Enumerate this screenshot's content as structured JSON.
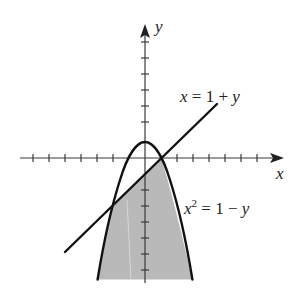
{
  "diagram": {
    "type": "region-between-curves",
    "colors": {
      "axis": "#3a3a3a",
      "curve": "#111111",
      "shade": "#b9b9b9",
      "background": "#ffffff"
    },
    "axes": {
      "x_label": "x",
      "y_label": "y",
      "x_ticks": [
        -7,
        -6,
        -5,
        -4,
        -3,
        -2,
        -1,
        1,
        2,
        3,
        4,
        5,
        6,
        7
      ],
      "y_ticks": [
        -7,
        -6,
        -5,
        -4,
        -3,
        -2,
        -1,
        1,
        2,
        3,
        4,
        5,
        6,
        7
      ]
    },
    "curves": [
      {
        "name": "line",
        "equation": {
          "lhs": "x",
          "eq": "=",
          "c": "1",
          "op": "+",
          "v": "y"
        },
        "label": "x = 1 + y"
      },
      {
        "name": "parabola",
        "equation": {
          "lhs": "x",
          "sup": "2",
          "eq": "=",
          "c": "1",
          "op": "−",
          "v": "y"
        },
        "label": "x² = 1 − y"
      }
    ],
    "intersections": [
      [
        -2,
        -3
      ],
      [
        1,
        0
      ]
    ],
    "shaded_region": "below x = 1 + y region bounded by parabola x² = 1 − y (lower part)"
  }
}
